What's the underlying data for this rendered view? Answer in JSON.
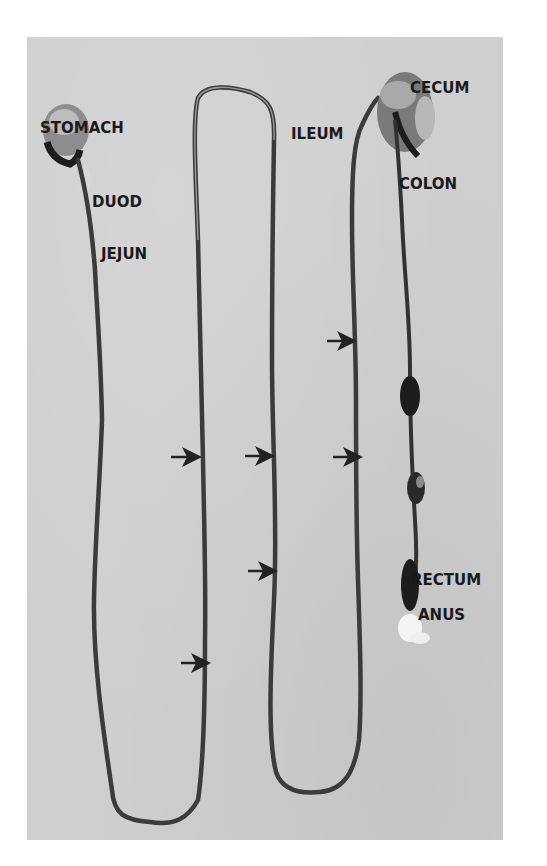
{
  "figure": {
    "background_color": "#cfcfcf",
    "tract_color": "#3a3a3a",
    "labels": [
      {
        "id": "stomach",
        "text": "STOMACH",
        "x": 40,
        "y": 121
      },
      {
        "id": "duod",
        "text": "DUOD",
        "x": 92,
        "y": 195
      },
      {
        "id": "jejun",
        "text": "JEJUN",
        "x": 101,
        "y": 247
      },
      {
        "id": "ileum",
        "text": "ILEUM",
        "x": 291,
        "y": 127
      },
      {
        "id": "cecum",
        "text": "CECUM",
        "x": 410,
        "y": 81
      },
      {
        "id": "colon",
        "text": "COLON",
        "x": 399,
        "y": 177
      },
      {
        "id": "rectum",
        "text": "RECTUM",
        "x": 411,
        "y": 573
      },
      {
        "id": "anus",
        "text": "ANUS",
        "x": 418,
        "y": 608
      }
    ],
    "arrows": [
      {
        "x1": 327,
        "x2": 354,
        "y": 341
      },
      {
        "x1": 171,
        "x2": 199,
        "y": 457
      },
      {
        "x1": 245,
        "x2": 272,
        "y": 456
      },
      {
        "x1": 333,
        "x2": 360,
        "y": 457
      },
      {
        "x1": 248,
        "x2": 275,
        "y": 571
      },
      {
        "x1": 181,
        "x2": 208,
        "y": 663
      }
    ]
  }
}
